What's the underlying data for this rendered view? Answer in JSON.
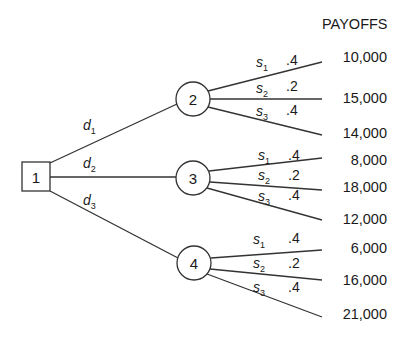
{
  "header": {
    "payoffs_label": "PAYOFFS"
  },
  "decision_node": {
    "id": "1",
    "label": "1"
  },
  "decisions": [
    {
      "label": "d",
      "sub": "1",
      "to_node": "2"
    },
    {
      "label": "d",
      "sub": "2",
      "to_node": "3"
    },
    {
      "label": "d",
      "sub": "3",
      "to_node": "4"
    }
  ],
  "chance_nodes": [
    {
      "label": "2",
      "branches": [
        {
          "state": "s",
          "sub": "1",
          "prob": ".4",
          "payoff": "10,000"
        },
        {
          "state": "s",
          "sub": "2",
          "prob": ".2",
          "payoff": "15,000"
        },
        {
          "state": "s",
          "sub": "3",
          "prob": ".4",
          "payoff": "14,000"
        }
      ]
    },
    {
      "label": "3",
      "branches": [
        {
          "state": "s",
          "sub": "1",
          "prob": ".4",
          "payoff": "8,000"
        },
        {
          "state": "s",
          "sub": "2",
          "prob": ".2",
          "payoff": "18,000"
        },
        {
          "state": "s",
          "sub": "3",
          "prob": ".4",
          "payoff": "12,000"
        }
      ]
    },
    {
      "label": "4",
      "branches": [
        {
          "state": "s",
          "sub": "1",
          "prob": ".4",
          "payoff": "6,000"
        },
        {
          "state": "s",
          "sub": "2",
          "prob": ".2",
          "payoff": "16,000"
        },
        {
          "state": "s",
          "sub": "3",
          "prob": ".4",
          "payoff": "21,000"
        }
      ]
    }
  ],
  "colors": {
    "line": "#333333",
    "text": "#1a1a1a",
    "background": "#ffffff"
  }
}
